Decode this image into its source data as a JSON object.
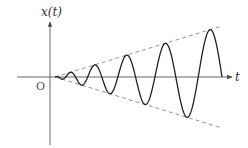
{
  "chart_data": {
    "type": "line",
    "title": "",
    "xlabel": "t",
    "ylabel": "x(t)",
    "origin_label": "O",
    "envelope": {
      "style": "dashed",
      "upper_slope": 1,
      "lower_slope": -1
    },
    "oscillation": {
      "cycles": 6.5,
      "amplitude_growth": "linear"
    },
    "colors": {
      "curve": "#222222",
      "axes": "#555555",
      "envelope": "#888888"
    }
  }
}
